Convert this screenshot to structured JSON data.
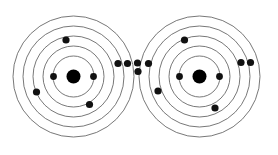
{
  "diagram": {
    "type": "atomic-shell-diagram",
    "background_color": "#ffffff",
    "ring_color": "#555555",
    "ring_stroke_width": 0.8,
    "electron_color": "#111111",
    "nucleus_color": "#000000",
    "canvas": {
      "width": 278,
      "height": 155
    },
    "atoms": [
      {
        "id": "atom-left",
        "label": "left-atom",
        "center": {
          "x": 73.5,
          "y": 76.5
        },
        "nucleus_radius": 7.0,
        "shell_radii": [
          20.5,
          30.5,
          40.5,
          50.5,
          60.5
        ],
        "shell_count": 5,
        "electrons": [
          {
            "id": "e-l1",
            "x": 53.5,
            "y": 76.5,
            "r": 3.4,
            "shell": 1
          },
          {
            "id": "e-l2",
            "x": 93.5,
            "y": 76.5,
            "r": 3.4,
            "shell": 1
          },
          {
            "id": "e-l3",
            "x": 66.0,
            "y": 40.0,
            "r": 3.6,
            "shell": 4
          },
          {
            "id": "e-l4",
            "x": 36.5,
            "y": 92.0,
            "r": 3.6,
            "shell": 5
          },
          {
            "id": "e-l5",
            "x": 89.5,
            "y": 104.5,
            "r": 3.6,
            "shell": 3
          }
        ]
      },
      {
        "id": "atom-right",
        "label": "right-atom",
        "center": {
          "x": 199.5,
          "y": 76.5
        },
        "nucleus_radius": 7.0,
        "shell_radii": [
          20.5,
          30.5,
          40.5,
          50.5,
          60.5
        ],
        "shell_count": 5,
        "electrons": [
          {
            "id": "e-r1",
            "x": 179.5,
            "y": 76.5,
            "r": 3.4,
            "shell": 1
          },
          {
            "id": "e-r2",
            "x": 219.5,
            "y": 76.5,
            "r": 3.4,
            "shell": 1
          },
          {
            "id": "e-r3",
            "x": 184.5,
            "y": 40.0,
            "r": 3.6,
            "shell": 4
          },
          {
            "id": "e-r4",
            "x": 158.0,
            "y": 91.0,
            "r": 3.6,
            "shell": 4
          },
          {
            "id": "e-r5",
            "x": 215.0,
            "y": 108.0,
            "r": 3.6,
            "shell": 3
          }
        ]
      }
    ],
    "bond_electrons": [
      {
        "id": "e-b1",
        "x": 118.0,
        "y": 63.5,
        "r": 3.6
      },
      {
        "id": "e-b2",
        "x": 127.5,
        "y": 63.5,
        "r": 3.6
      },
      {
        "id": "e-b3",
        "x": 137.5,
        "y": 63.0,
        "r": 3.6
      },
      {
        "id": "e-b4",
        "x": 138.0,
        "y": 71.5,
        "r": 3.6
      },
      {
        "id": "e-b5",
        "x": 148.5,
        "y": 63.5,
        "r": 3.6
      }
    ],
    "outer_right_electrons": [
      {
        "id": "e-o1",
        "x": 241.0,
        "y": 62.5,
        "r": 3.6
      },
      {
        "id": "e-o2",
        "x": 250.5,
        "y": 62.5,
        "r": 3.6
      }
    ]
  }
}
